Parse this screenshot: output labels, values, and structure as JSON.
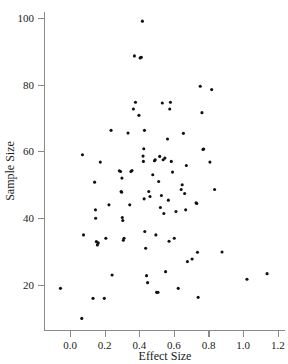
{
  "chart_data": {
    "type": "scatter",
    "title": "",
    "xlabel": "Effect Size",
    "ylabel": "Sample Size",
    "xlim": [
      -0.09,
      1.23
    ],
    "ylim": [
      7,
      103
    ],
    "xticks": [
      0.0,
      0.2,
      0.4,
      0.6,
      0.8,
      1.0,
      1.2
    ],
    "xtick_labels": [
      "0.0",
      "0.2",
      "0.4",
      "0.6",
      "0.8",
      "1.0",
      "1.2"
    ],
    "yticks": [
      20,
      40,
      60,
      80,
      100
    ],
    "ytick_labels": [
      "20",
      "40",
      "60",
      "80",
      "100"
    ],
    "grid": false,
    "legend": null,
    "marker": "dot",
    "marker_color": "#111111",
    "axis_color": "#8a8a8a",
    "points": [
      {
        "x": -0.055,
        "y": 19.0
      },
      {
        "x": 0.068,
        "y": 10.0
      },
      {
        "x": 0.072,
        "y": 59.0
      },
      {
        "x": 0.078,
        "y": 35.0
      },
      {
        "x": 0.133,
        "y": 16.0
      },
      {
        "x": 0.142,
        "y": 50.8
      },
      {
        "x": 0.147,
        "y": 42.5
      },
      {
        "x": 0.148,
        "y": 40.0
      },
      {
        "x": 0.152,
        "y": 33.0
      },
      {
        "x": 0.158,
        "y": 32.0
      },
      {
        "x": 0.163,
        "y": 32.6
      },
      {
        "x": 0.175,
        "y": 56.8
      },
      {
        "x": 0.198,
        "y": 16.0
      },
      {
        "x": 0.207,
        "y": 34.0
      },
      {
        "x": 0.225,
        "y": 44.0
      },
      {
        "x": 0.237,
        "y": 66.3
      },
      {
        "x": 0.243,
        "y": 23.0
      },
      {
        "x": 0.285,
        "y": 54.2
      },
      {
        "x": 0.292,
        "y": 54.0
      },
      {
        "x": 0.295,
        "y": 48.0
      },
      {
        "x": 0.298,
        "y": 47.8
      },
      {
        "x": 0.3,
        "y": 52.0
      },
      {
        "x": 0.302,
        "y": 40.2
      },
      {
        "x": 0.305,
        "y": 39.3
      },
      {
        "x": 0.308,
        "y": 33.4
      },
      {
        "x": 0.312,
        "y": 34.0
      },
      {
        "x": 0.335,
        "y": 65.5
      },
      {
        "x": 0.345,
        "y": 44.0
      },
      {
        "x": 0.352,
        "y": 54.0
      },
      {
        "x": 0.358,
        "y": 54.3
      },
      {
        "x": 0.366,
        "y": 72.7
      },
      {
        "x": 0.372,
        "y": 88.6
      },
      {
        "x": 0.378,
        "y": 74.7
      },
      {
        "x": 0.398,
        "y": 70.8
      },
      {
        "x": 0.405,
        "y": 88.0
      },
      {
        "x": 0.412,
        "y": 88.2
      },
      {
        "x": 0.418,
        "y": 99.0
      },
      {
        "x": 0.422,
        "y": 58.6
      },
      {
        "x": 0.424,
        "y": 57.0
      },
      {
        "x": 0.426,
        "y": 60.8
      },
      {
        "x": 0.428,
        "y": 45.8
      },
      {
        "x": 0.43,
        "y": 66.3
      },
      {
        "x": 0.432,
        "y": 36.0
      },
      {
        "x": 0.437,
        "y": 31.0
      },
      {
        "x": 0.442,
        "y": 22.8
      },
      {
        "x": 0.448,
        "y": 20.7
      },
      {
        "x": 0.455,
        "y": 48.0
      },
      {
        "x": 0.462,
        "y": 46.5
      },
      {
        "x": 0.478,
        "y": 53.0
      },
      {
        "x": 0.488,
        "y": 57.2
      },
      {
        "x": 0.492,
        "y": 57.5
      },
      {
        "x": 0.496,
        "y": 35.0
      },
      {
        "x": 0.5,
        "y": 17.8
      },
      {
        "x": 0.508,
        "y": 17.8
      },
      {
        "x": 0.512,
        "y": 51.0
      },
      {
        "x": 0.518,
        "y": 58.5
      },
      {
        "x": 0.522,
        "y": 43.2
      },
      {
        "x": 0.528,
        "y": 46.8
      },
      {
        "x": 0.533,
        "y": 74.5
      },
      {
        "x": 0.538,
        "y": 57.5
      },
      {
        "x": 0.542,
        "y": 41.4
      },
      {
        "x": 0.548,
        "y": 58.0
      },
      {
        "x": 0.552,
        "y": 24.0
      },
      {
        "x": 0.563,
        "y": 63.7
      },
      {
        "x": 0.568,
        "y": 45.4
      },
      {
        "x": 0.572,
        "y": 33.1
      },
      {
        "x": 0.576,
        "y": 72.7
      },
      {
        "x": 0.58,
        "y": 74.7
      },
      {
        "x": 0.585,
        "y": 57.0
      },
      {
        "x": 0.592,
        "y": 53.8
      },
      {
        "x": 0.602,
        "y": 34.0
      },
      {
        "x": 0.612,
        "y": 42.0
      },
      {
        "x": 0.625,
        "y": 19.0
      },
      {
        "x": 0.642,
        "y": 48.6
      },
      {
        "x": 0.648,
        "y": 50.0
      },
      {
        "x": 0.655,
        "y": 65.4
      },
      {
        "x": 0.662,
        "y": 47.4
      },
      {
        "x": 0.668,
        "y": 42.5
      },
      {
        "x": 0.672,
        "y": 55.8
      },
      {
        "x": 0.678,
        "y": 27.0
      },
      {
        "x": 0.705,
        "y": 27.8
      },
      {
        "x": 0.728,
        "y": 44.6
      },
      {
        "x": 0.732,
        "y": 44.4
      },
      {
        "x": 0.736,
        "y": 29.8
      },
      {
        "x": 0.74,
        "y": 16.3
      },
      {
        "x": 0.752,
        "y": 79.5
      },
      {
        "x": 0.762,
        "y": 71.6
      },
      {
        "x": 0.768,
        "y": 60.6
      },
      {
        "x": 0.772,
        "y": 60.7
      },
      {
        "x": 0.808,
        "y": 56.8
      },
      {
        "x": 0.818,
        "y": 78.5
      },
      {
        "x": 0.835,
        "y": 48.6
      },
      {
        "x": 0.878,
        "y": 29.9
      },
      {
        "x": 1.022,
        "y": 21.7
      },
      {
        "x": 1.138,
        "y": 23.4
      }
    ]
  }
}
